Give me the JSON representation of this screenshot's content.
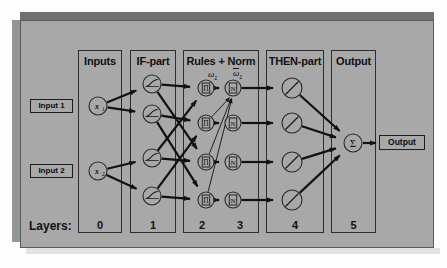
{
  "diagram": {
    "background_color": "#a8a8a8",
    "line_color": "#111111"
  },
  "columns": [
    {
      "id": "inputs",
      "header": "Inputs",
      "layer": "0",
      "x": 78,
      "width": 44
    },
    {
      "id": "if-part",
      "header": "IF-part",
      "layer": "1",
      "x": 130,
      "width": 46
    },
    {
      "id": "rules-norm",
      "header": "Rules + Norm",
      "layer": "2",
      "x": 183,
      "width": 76
    },
    {
      "id": "then-part",
      "header": "THEN-part",
      "layer": "4",
      "x": 266,
      "width": 58
    },
    {
      "id": "output",
      "header": "Output",
      "layer": "5",
      "x": 331,
      "width": 45
    }
  ],
  "layers_label": "Layers:",
  "layer_numbers": [
    {
      "value": "0",
      "x": 78,
      "width": 44
    },
    {
      "value": "1",
      "x": 130,
      "width": 46
    },
    {
      "value": "2",
      "x": 183,
      "width": 38
    },
    {
      "value": "3",
      "x": 221,
      "width": 38
    },
    {
      "value": "4",
      "x": 266,
      "width": 58
    },
    {
      "value": "5",
      "x": 331,
      "width": 45
    }
  ],
  "input_tags": [
    {
      "label": "Input 1",
      "x": 30,
      "y": 99,
      "width": 43
    },
    {
      "label": "Input 2",
      "x": 30,
      "y": 164,
      "width": 43
    }
  ],
  "output_tag": {
    "label": "Output"
  },
  "input_nodes": [
    {
      "label": "x",
      "subscript": "1",
      "cx": 98,
      "cy": 106,
      "r": 9
    },
    {
      "label": "x",
      "subscript": "2",
      "cx": 98,
      "cy": 171,
      "r": 9
    }
  ],
  "if_nodes": [
    {
      "glyph": "membership-curve",
      "cx": 152,
      "cy": 84,
      "r": 9
    },
    {
      "glyph": "membership-curve",
      "cx": 152,
      "cy": 114,
      "r": 9
    },
    {
      "glyph": "membership-curve",
      "cx": 152,
      "cy": 158,
      "r": 9
    },
    {
      "glyph": "membership-curve",
      "cx": 152,
      "cy": 196,
      "r": 9
    }
  ],
  "rule_nodes": [
    {
      "glyph": "Π",
      "cx": 206,
      "cy": 88,
      "r": 8
    },
    {
      "glyph": "Π",
      "cx": 206,
      "cy": 123,
      "r": 8
    },
    {
      "glyph": "Π",
      "cx": 206,
      "cy": 162,
      "r": 8
    },
    {
      "glyph": "Π",
      "cx": 206,
      "cy": 200,
      "r": 8
    }
  ],
  "norm_nodes": [
    {
      "glyph": "N",
      "cx": 233,
      "cy": 88,
      "r": 8
    },
    {
      "glyph": "N",
      "cx": 233,
      "cy": 123,
      "r": 8
    },
    {
      "glyph": "N",
      "cx": 233,
      "cy": 162,
      "r": 8
    },
    {
      "glyph": "N",
      "cx": 233,
      "cy": 200,
      "r": 8
    }
  ],
  "then_nodes": [
    {
      "glyph": "linear-slash",
      "cx": 292,
      "cy": 88,
      "r": 10
    },
    {
      "glyph": "linear-slash",
      "cx": 292,
      "cy": 123,
      "r": 10
    },
    {
      "glyph": "linear-slash",
      "cx": 292,
      "cy": 162,
      "r": 10
    },
    {
      "glyph": "linear-slash",
      "cx": 292,
      "cy": 200,
      "r": 10
    }
  ],
  "sum_node": {
    "glyph": "Σ",
    "cx": 353,
    "cy": 143,
    "r": 9
  },
  "weight_labels": [
    {
      "text": "ω",
      "subscript": "1",
      "overbar": false,
      "x": 208,
      "y": 70
    },
    {
      "text": "ω",
      "subscript": "1",
      "overbar": true,
      "x": 233,
      "y": 69
    }
  ]
}
